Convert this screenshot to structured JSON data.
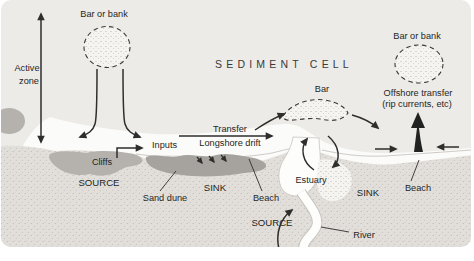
{
  "figure": {
    "title": "SEDIMENT CELL",
    "labels": {
      "bar_or_bank_left": "Bar or bank",
      "bar_or_bank_right": "Bar or bank",
      "active_zone_line1": "Active",
      "active_zone_line2": "zone",
      "inputs": "Inputs",
      "transfer": "Transfer",
      "longshore_drift": "Longshore drift",
      "cliffs": "Cliffs",
      "source_left": "SOURCE",
      "sand_dune": "Sand dune",
      "sink_left": "SINK",
      "beach_left": "Beach",
      "bar": "Bar",
      "offshore_transfer_line1": "Offshore transfer",
      "offshore_transfer_line2": "(rip currents, etc)",
      "estuary": "Estuary",
      "sink_right": "SINK",
      "beach_right": "Beach",
      "source_river": "SOURCE",
      "river": "River"
    },
    "colors": {
      "sea": "#ecebe8",
      "nearshore": "#fbfbf9",
      "land": "#e2dfda",
      "cliff": "#b5b2ae",
      "dune": "#a6a39e",
      "ink": "#2e2e2c"
    }
  }
}
